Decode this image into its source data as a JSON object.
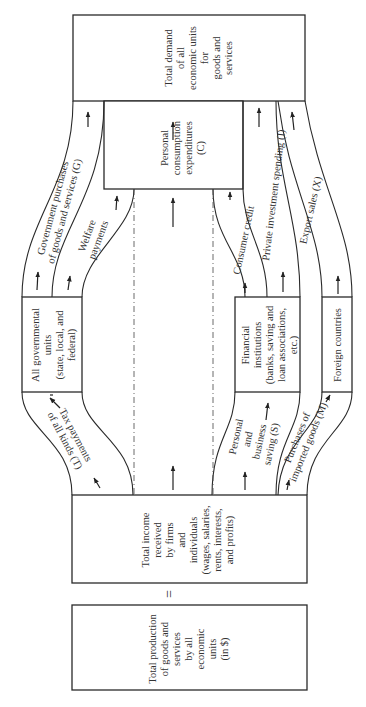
{
  "diagram": {
    "type": "circular-flow-of-income",
    "orientation": "rotated-90-ccw",
    "nodes": {
      "total_demand": {
        "lines": [
          "Total demand",
          "of all",
          "economic units",
          "for",
          "goods and",
          "services"
        ]
      },
      "personal_consumption": {
        "lines": [
          "Personal",
          "consumption",
          "expenditures",
          "(C)"
        ]
      },
      "government": {
        "lines": [
          "All governmental",
          "units",
          "(state, local, and",
          "federal)"
        ]
      },
      "financial": {
        "lines": [
          "Financial",
          "institutions",
          "(banks, saving and",
          "loan associations,",
          "etc.)"
        ]
      },
      "foreign": {
        "lines": [
          "Foreign countries"
        ]
      },
      "total_income": {
        "lines": [
          "Total income",
          "received",
          "by firms",
          "and",
          "individuals",
          "(wages, salaries,",
          "rents, interests,",
          "and profits)"
        ]
      },
      "total_production": {
        "lines": [
          "Total production",
          "of goods and",
          "services",
          "by all",
          "economic",
          "units",
          "(in $)"
        ]
      }
    },
    "flows": {
      "gov_purchases": {
        "lines": [
          "Government purchases",
          "of goods and services (G)"
        ]
      },
      "welfare": {
        "lines": [
          "Welfare",
          "payments"
        ]
      },
      "consumer_credit": {
        "lines": [
          "Consumer credit"
        ]
      },
      "investment": {
        "lines": [
          "Private investment spending (I)"
        ]
      },
      "exports": {
        "lines": [
          "Export sales (X)"
        ]
      },
      "taxes": {
        "lines": [
          "Tax payments",
          "of all kinds (T)"
        ]
      },
      "saving": {
        "lines": [
          "Personal",
          "and",
          "business",
          "saving (S)"
        ]
      },
      "imports": {
        "lines": [
          "Purchases of",
          "imported goods (M)"
        ]
      }
    },
    "equals_symbol": "="
  }
}
